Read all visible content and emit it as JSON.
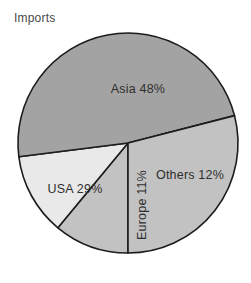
{
  "chart_data": {
    "type": "pie",
    "title": "Imports",
    "xlabel": "",
    "ylabel": "",
    "legend_position": "none",
    "grid": false,
    "unit": "%",
    "categories": [
      "Asia",
      "USA",
      "Others",
      "Europe"
    ],
    "values": [
      48,
      29,
      12,
      11
    ],
    "slices": [
      {
        "name": "Asia",
        "value": 48,
        "label": "Asia 48%",
        "color": "#a3a3a3",
        "label_x": 138,
        "label_y": 90,
        "rotation": 0
      },
      {
        "name": "USA",
        "value": 29,
        "label": "USA 29%",
        "color": "#c2c2c2",
        "label_x": 75,
        "label_y": 190,
        "rotation": 0
      },
      {
        "name": "Others",
        "value": 12,
        "label": "Others 12%",
        "color": "#e9e9e9",
        "label_x": 190,
        "label_y": 176,
        "rotation": 0
      },
      {
        "name": "Europe",
        "value": 11,
        "label": "Europe 11%",
        "color": "#c2c2c2",
        "label_x": 143,
        "label_y": 205,
        "rotation": -90
      }
    ],
    "geometry": {
      "center_x": 128,
      "center_y": 143,
      "radius": 110,
      "start_angle_deg": 90,
      "direction": "clockwise"
    },
    "outline_color": "#1c1c1c",
    "background_color": "#ffffff"
  }
}
